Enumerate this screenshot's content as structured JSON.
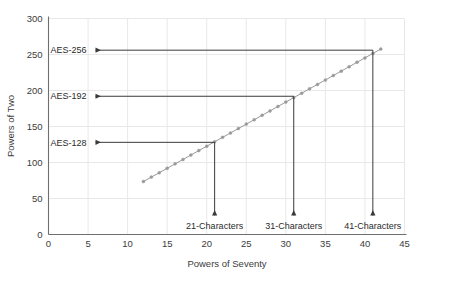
{
  "chart_data": {
    "type": "line",
    "title": "",
    "xlabel": "Powers of Seventy",
    "ylabel": "Powers of Two",
    "xlim": [
      0,
      45
    ],
    "ylim": [
      0,
      300
    ],
    "xticks": [
      "0",
      "5",
      "10",
      "15",
      "20",
      "25",
      "30",
      "35",
      "40",
      "45"
    ],
    "xtick_values": [
      0,
      5,
      10,
      15,
      20,
      25,
      30,
      35,
      40,
      45
    ],
    "yticks": [
      "0",
      "50",
      "100",
      "150",
      "200",
      "250",
      "300"
    ],
    "ytick_values": [
      0,
      50,
      100,
      150,
      200,
      250,
      300
    ],
    "grid": true,
    "legend": "none",
    "series": [
      {
        "name": "log2(70^x)",
        "marker": "circle",
        "color": "#9a9a9a",
        "x": [
          12,
          13,
          14,
          15,
          16,
          17,
          18,
          19,
          20,
          21,
          22,
          23,
          24,
          25,
          26,
          27,
          28,
          29,
          30,
          31,
          32,
          33,
          34,
          35,
          36,
          37,
          38,
          39,
          40,
          41,
          42
        ],
        "y": [
          73.6,
          79.7,
          85.8,
          92.0,
          98.1,
          104.2,
          110.4,
          116.5,
          122.6,
          128.8,
          134.9,
          141.0,
          147.2,
          153.3,
          159.4,
          165.6,
          171.7,
          177.8,
          184.0,
          190.1,
          196.2,
          202.4,
          208.5,
          214.6,
          220.8,
          226.9,
          233.0,
          239.2,
          245.3,
          251.4,
          257.6
        ]
      }
    ],
    "annotations": [
      {
        "id": "aes-128",
        "label": "AES-128",
        "y_value": 128,
        "x_value": 21,
        "x_label": "21-Characters"
      },
      {
        "id": "aes-192",
        "label": "AES-192",
        "y_value": 192,
        "x_value": 31,
        "x_label": "31-Characters"
      },
      {
        "id": "aes-256",
        "label": "AES-256",
        "y_value": 256,
        "x_value": 41,
        "x_label": "41-Characters"
      }
    ],
    "colors": {
      "line": "#9a9a9a",
      "marker": "#9a9a9a",
      "annotation": "#3a3a3a",
      "axis": "#6e6e6e",
      "grid": "#e8e8e8",
      "text": "#3c3c3c",
      "background": "#ffffff"
    }
  }
}
